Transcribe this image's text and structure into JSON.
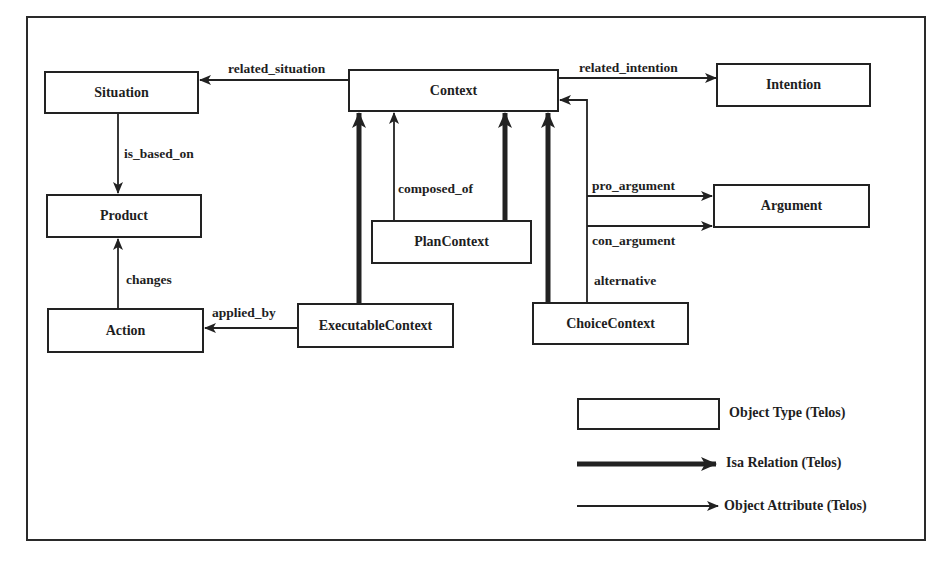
{
  "diagram": {
    "nodes": [
      {
        "id": "situation",
        "label": "Situation"
      },
      {
        "id": "context",
        "label": "Context"
      },
      {
        "id": "intention",
        "label": "Intention"
      },
      {
        "id": "product",
        "label": "Product"
      },
      {
        "id": "argument",
        "label": "Argument"
      },
      {
        "id": "plan_context",
        "label": "PlanContext"
      },
      {
        "id": "action",
        "label": "Action"
      },
      {
        "id": "executable_context",
        "label": "ExecutableContext"
      },
      {
        "id": "choice_context",
        "label": "ChoiceContext"
      }
    ],
    "edges": [
      {
        "from": "context",
        "to": "situation",
        "label": "related_situation",
        "type": "attribute"
      },
      {
        "from": "context",
        "to": "intention",
        "label": "related_intention",
        "type": "attribute"
      },
      {
        "from": "situation",
        "to": "product",
        "label": "is_based_on",
        "type": "attribute"
      },
      {
        "from": "action",
        "to": "product",
        "label": "changes",
        "type": "attribute"
      },
      {
        "from": "executable_context",
        "to": "action",
        "label": "applied_by",
        "type": "attribute"
      },
      {
        "from": "plan_context",
        "to": "context",
        "label": "composed_of",
        "type": "attribute"
      },
      {
        "from": "choice_context",
        "to": "argument",
        "label": "pro_argument",
        "type": "attribute"
      },
      {
        "from": "choice_context",
        "to": "argument",
        "label": "con_argument",
        "type": "attribute"
      },
      {
        "from": "choice_context",
        "to": "context",
        "label": "alternative",
        "type": "attribute"
      },
      {
        "from": "executable_context",
        "to": "context",
        "label": "",
        "type": "isa"
      },
      {
        "from": "plan_context",
        "to": "context",
        "label": "",
        "type": "isa"
      },
      {
        "from": "choice_context",
        "to": "context",
        "label": "",
        "type": "isa"
      }
    ]
  },
  "labels": {
    "situation": "Situation",
    "context": "Context",
    "intention": "Intention",
    "product": "Product",
    "argument": "Argument",
    "plan_context": "PlanContext",
    "action": "Action",
    "executable_context": "ExecutableContext",
    "choice_context": "ChoiceContext",
    "related_situation": "related_situation",
    "related_intention": "related_intention",
    "is_based_on": "is_based_on",
    "changes": "changes",
    "applied_by": "applied_by",
    "composed_of": "composed_of",
    "pro_argument": "pro_argument",
    "con_argument": "con_argument",
    "alternative": "alternative"
  },
  "legend": {
    "object_type": "Object Type (Telos)",
    "isa_relation": "Isa Relation (Telos)",
    "object_attribute": "Object Attribute (Telos)"
  },
  "colors": {
    "line": "#222222",
    "background": "#ffffff"
  }
}
